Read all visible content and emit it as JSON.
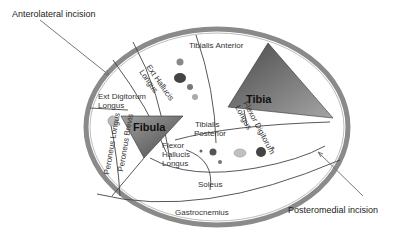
{
  "diagram": {
    "incisions": {
      "anterolateral": "Anterolateral incision",
      "posteromedial": "Posteromedial incision"
    },
    "bones": {
      "tibia": "Tibia",
      "fibula": "Fibula"
    },
    "muscles": {
      "tibialis_anterior": "Tibialis Anterior",
      "ext_hallucis_1": "Ext Hallucis",
      "ext_hallucis_2": "Longus",
      "ext_digitorum_1": "Ext Digitorum",
      "ext_digitorum_2": "Longus",
      "tibialis_posterior_1": "Tibialis",
      "tibialis_posterior_2": "Posterior",
      "flexor_digitorum_1": "Flexor Digitorum",
      "flexor_digitorum_2": "Longus",
      "flexor_hallucis_1": "Flexor",
      "flexor_hallucis_2": "Hallucis",
      "flexor_hallucis_3": "Longus",
      "peroneus_longus": "Peroneus Longus",
      "peroneus_brevis": "Peroneus Brevis",
      "soleus": "Soleus",
      "gastrocnemius": "Gastrocnemius"
    },
    "colors": {
      "ring": "#8a8a8a",
      "bone_dark": "#555555",
      "bone_light": "#9a9a9a",
      "line": "#444444",
      "arrow": "#777777"
    }
  }
}
